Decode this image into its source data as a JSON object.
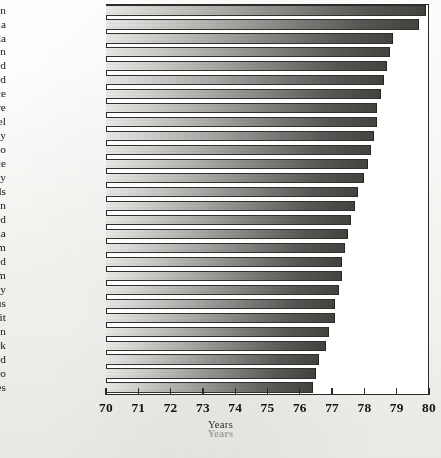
{
  "chart_data": {
    "type": "bar",
    "orientation": "horizontal",
    "title": "",
    "xlabel": "Years",
    "ylabel": "",
    "xlim": [
      70,
      80
    ],
    "xticks": [
      70,
      71,
      72,
      73,
      74,
      75,
      76,
      77,
      78,
      79,
      80
    ],
    "grid": false,
    "legend": null,
    "categories": [
      "Japan",
      "Australia",
      "Canada",
      "Sweden",
      "Switzerland",
      "Iceland",
      "France",
      "Singapore",
      "Israel",
      "Italy",
      "Monaco",
      "Greece",
      "Norway",
      "Netherlands",
      "Spain",
      "New Zealand",
      "Austria",
      "Belgium",
      "Finland",
      "United Kingdom",
      "Germany",
      "Cyprus",
      "Kuwait",
      "Taiwan",
      "Denmark",
      "Ireland",
      "Montenegro",
      "United States"
    ],
    "values": [
      79.9,
      79.7,
      78.9,
      78.8,
      78.7,
      78.6,
      78.5,
      78.4,
      78.4,
      78.3,
      78.2,
      78.1,
      78.0,
      77.8,
      77.7,
      77.6,
      77.5,
      77.4,
      77.3,
      77.3,
      77.2,
      77.1,
      77.1,
      76.9,
      76.8,
      76.6,
      76.5,
      76.4
    ],
    "ghost_xlabel": "Years",
    "colors": {
      "bar_light": "#e8e8e6",
      "bar_dark": "#434340",
      "axis": "#2a2a2a",
      "text": "#141414",
      "background": "#ffffff"
    }
  },
  "caption": ""
}
